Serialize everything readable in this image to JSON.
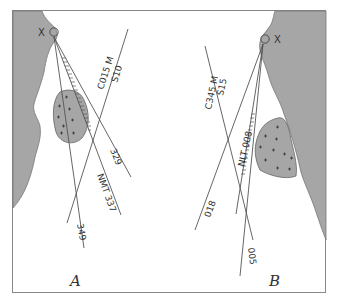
{
  "figure": {
    "panels": [
      {
        "id": "A",
        "label": "A",
        "point_label": "X",
        "bearing_lines": [
          {
            "label": "349"
          },
          {
            "label": "NMT 337"
          },
          {
            "label": "329"
          }
        ],
        "cross_line": {
          "label_top": "C015 M",
          "label_bottom": "S10"
        },
        "coast_side": "left"
      },
      {
        "id": "B",
        "label": "B",
        "point_label": "X",
        "bearing_lines": [
          {
            "label": "005"
          },
          {
            "label": "NLT 008"
          },
          {
            "label": "018"
          }
        ],
        "cross_line": {
          "label_top": "C345 M",
          "label_bottom": "S15"
        },
        "coast_side": "right"
      }
    ],
    "colors": {
      "land": "#a6a6a6",
      "line": "#555555",
      "frame": "#888888",
      "background": "#ffffff"
    }
  }
}
